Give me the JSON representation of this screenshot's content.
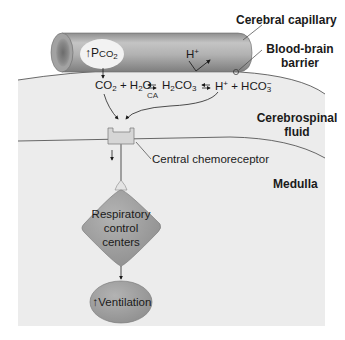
{
  "figure": {
    "regions": {
      "capillary_label": "Cerebral capillary",
      "bbb_label_line1": "Blood-brain",
      "bbb_label_line2": "barrier",
      "csf_label_line1": "Cerebrospinal",
      "csf_label_line2": "fluid",
      "medulla_label": "Medulla"
    },
    "capillary": {
      "pco2_arrow": "↑",
      "pco2_P": "P",
      "pco2_CO": "CO",
      "pco2_sub": "2",
      "h_plus": "H",
      "h_plus_sup": "+"
    },
    "equation": {
      "co2": "CO",
      "co2_sub": "2",
      "plus1": " + H",
      "h2o_sub": "2",
      "h2o_o": "O",
      "enzyme": "CA",
      "h2co3_h": "H",
      "h2co3_sub1": "2",
      "h2co3_co": "CO",
      "h2co3_sub2": "3",
      "h": "H",
      "h_sup": "+",
      "plus2": " + HCO",
      "hco3_sub": "3",
      "hco3_sup": "−"
    },
    "chemoreceptor_label": "Central chemoreceptor",
    "control_centers": {
      "line1": "Respiratory",
      "line2": "control",
      "line3": "centers"
    },
    "ventilation": {
      "arrow": "↑",
      "label": "Ventilation"
    },
    "colors": {
      "background_tissue": "#ececec",
      "capillary_body": "#a9a9a9",
      "node_fill": "#9c9c9c",
      "receptor_fill": "#d4d4d4",
      "line": "#333333"
    }
  }
}
